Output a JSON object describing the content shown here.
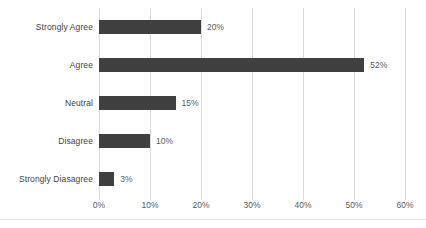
{
  "chart_data": {
    "type": "bar",
    "orientation": "horizontal",
    "title": "",
    "xlabel": "",
    "ylabel": "",
    "categories": [
      "Strongly Agree",
      "Agree",
      "Neutral",
      "Disagree",
      "Strongly Diasagree"
    ],
    "values": [
      20,
      52,
      15,
      10,
      3
    ],
    "data_labels": [
      "20%",
      "52%",
      "15%",
      "10%",
      "3%"
    ],
    "xlim": [
      0,
      60
    ],
    "xticks": [
      0,
      10,
      20,
      30,
      40,
      50,
      60
    ],
    "xticklabels": [
      "0%",
      "10%",
      "20%",
      "30%",
      "40%",
      "50%",
      "60%"
    ],
    "grid": true,
    "grid_axis": "x",
    "legend": false,
    "legend_position": "none",
    "bar_color": "#404040",
    "gridline_color": "#d9d9d9",
    "label_color": "#3f3f3f",
    "value_color": "#5a5a5a"
  }
}
